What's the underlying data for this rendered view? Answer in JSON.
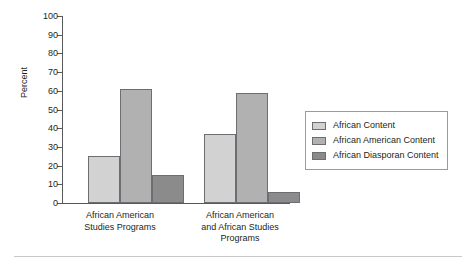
{
  "chart_data": {
    "type": "bar",
    "title": "",
    "xlabel": "",
    "ylabel": "Percent",
    "ylim": [
      0,
      100
    ],
    "ytick_step": 10,
    "yticks": [
      0,
      10,
      20,
      30,
      40,
      50,
      60,
      70,
      80,
      90,
      100
    ],
    "grid": false,
    "legend_position": "right",
    "categories": [
      "African American\nStudies Programs",
      "African American\nand African Studies\nPrograms"
    ],
    "category_labels": [
      "African American Studies Programs",
      "African American and African Studies Programs"
    ],
    "series": [
      {
        "name": "African Content",
        "values": [
          25,
          37
        ],
        "color": "#d2d2d2"
      },
      {
        "name": "African American Content",
        "values": [
          61,
          59
        ],
        "color": "#b1b1b1"
      },
      {
        "name": "African Diasporan Content",
        "values": [
          15,
          6
        ],
        "color": "#8b8b8b"
      }
    ]
  },
  "axis": {
    "y_title": "Percent",
    "tick_100": "100",
    "tick_90": "90",
    "tick_80": "80",
    "tick_70": "70",
    "tick_60": "60",
    "tick_50": "50",
    "tick_40": "40",
    "tick_30": "30",
    "tick_20": "20",
    "tick_10": "10",
    "tick_0": "0"
  },
  "categories": {
    "group0_line1": "African American",
    "group0_line2": "Studies Programs",
    "group1_line1": "African American",
    "group1_line2": "and African Studies",
    "group1_line3": "Programs"
  },
  "legend": {
    "item0": "African Content",
    "item1": "African American Content",
    "item2": "African Diasporan Content"
  }
}
